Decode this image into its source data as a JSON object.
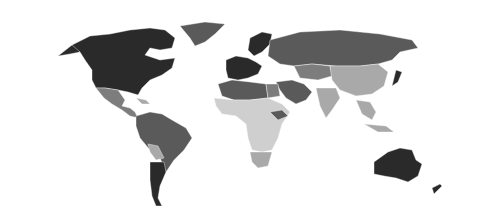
{
  "map": {
    "type": "choropleth-world",
    "legend_visible": false,
    "palette": {
      "darkest": "#2a2a2a",
      "dark": "#5a5a5a",
      "medium": "#7d7d7d",
      "light": "#a9a9a9",
      "lightest": "#cfcfcf",
      "background": "#ffffff"
    },
    "regions": [
      {
        "name": "north-america-canada-usa",
        "shade": "darkest"
      },
      {
        "name": "greenland",
        "shade": "dark"
      },
      {
        "name": "mexico-central-america",
        "shade": "medium"
      },
      {
        "name": "caribbean",
        "shade": "light"
      },
      {
        "name": "south-america-north",
        "shade": "dark"
      },
      {
        "name": "bolivia",
        "shade": "light"
      },
      {
        "name": "argentina-chile",
        "shade": "darkest"
      },
      {
        "name": "western-europe",
        "shade": "darkest"
      },
      {
        "name": "scandinavia",
        "shade": "darkest"
      },
      {
        "name": "russia",
        "shade": "dark"
      },
      {
        "name": "north-africa",
        "shade": "dark"
      },
      {
        "name": "egypt",
        "shade": "medium"
      },
      {
        "name": "middle-east",
        "shade": "dark"
      },
      {
        "name": "central-asia",
        "shade": "medium"
      },
      {
        "name": "china",
        "shade": "light"
      },
      {
        "name": "india",
        "shade": "light"
      },
      {
        "name": "japan",
        "shade": "darkest"
      },
      {
        "name": "sub-saharan-africa",
        "shade": "lightest"
      },
      {
        "name": "south-africa",
        "shade": "light"
      },
      {
        "name": "southeast-asia",
        "shade": "light"
      },
      {
        "name": "australia",
        "shade": "darkest"
      },
      {
        "name": "new-zealand",
        "shade": "darkest"
      }
    ]
  }
}
